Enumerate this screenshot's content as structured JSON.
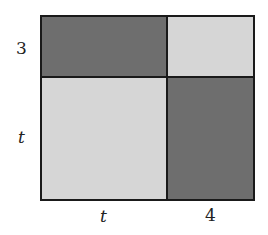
{
  "diagram": {
    "type": "area-model",
    "labels": {
      "left_top": "3",
      "left_bottom": "t",
      "bottom_left": "t",
      "bottom_right": "4"
    },
    "regions": [
      {
        "position": "top-left",
        "width": "t",
        "height": "3",
        "shade": "dark"
      },
      {
        "position": "top-right",
        "width": "4",
        "height": "3",
        "shade": "light"
      },
      {
        "position": "bottom-left",
        "width": "t",
        "height": "t",
        "shade": "light"
      },
      {
        "position": "bottom-right",
        "width": "4",
        "height": "t",
        "shade": "dark"
      }
    ],
    "colors": {
      "dark": "#6e6e6e",
      "light": "#d6d6d6",
      "border": "#1a1a1a"
    }
  }
}
